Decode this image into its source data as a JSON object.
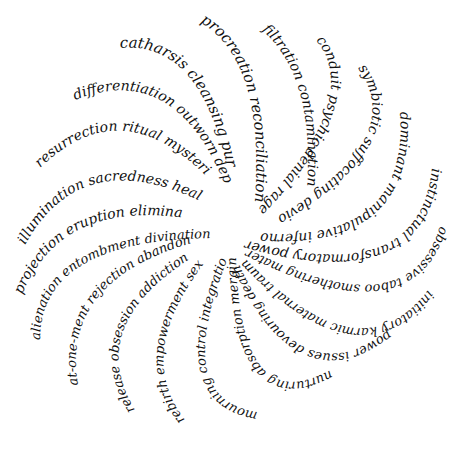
{
  "figure": {
    "type": "calligraphic word spiral",
    "arms": [
      {
        "id": "arm1",
        "words": "procreation reconciliation"
      },
      {
        "id": "arm2",
        "words": "filtration contamination"
      },
      {
        "id": "arm3",
        "words": "conduit psychic denial rage"
      },
      {
        "id": "arm4",
        "words": "symbiotic suffocating devious"
      },
      {
        "id": "arm5",
        "words": "dominant manipulative inferno"
      },
      {
        "id": "arm6",
        "words": "instinctual transformatory power"
      },
      {
        "id": "arm7",
        "words": "obsessive taboo smothering maternal"
      },
      {
        "id": "arm8",
        "words": "initiatory karmic maternal trauma"
      },
      {
        "id": "arm9",
        "words": "power issues devouring death"
      },
      {
        "id": "arm10",
        "words": "nurturing absorption merging loss"
      },
      {
        "id": "arm11",
        "words": "mourning control integration sex"
      },
      {
        "id": "arm12",
        "words": "rebirth empowerment sex"
      },
      {
        "id": "arm13",
        "words": "release obsession addiction"
      },
      {
        "id": "arm14",
        "words": "at-one-ment rejection abandonment"
      },
      {
        "id": "arm15",
        "words": "alienation entombment divination"
      },
      {
        "id": "arm16",
        "words": "projection eruption elimination"
      },
      {
        "id": "arm17",
        "words": "illumination sacredness healing"
      },
      {
        "id": "arm18",
        "words": "resurrection ritual mysteries"
      },
      {
        "id": "arm19",
        "words": "differentiation outworn dependence"
      },
      {
        "id": "arm20",
        "words": "catharsis cleansing purgation"
      }
    ]
  }
}
